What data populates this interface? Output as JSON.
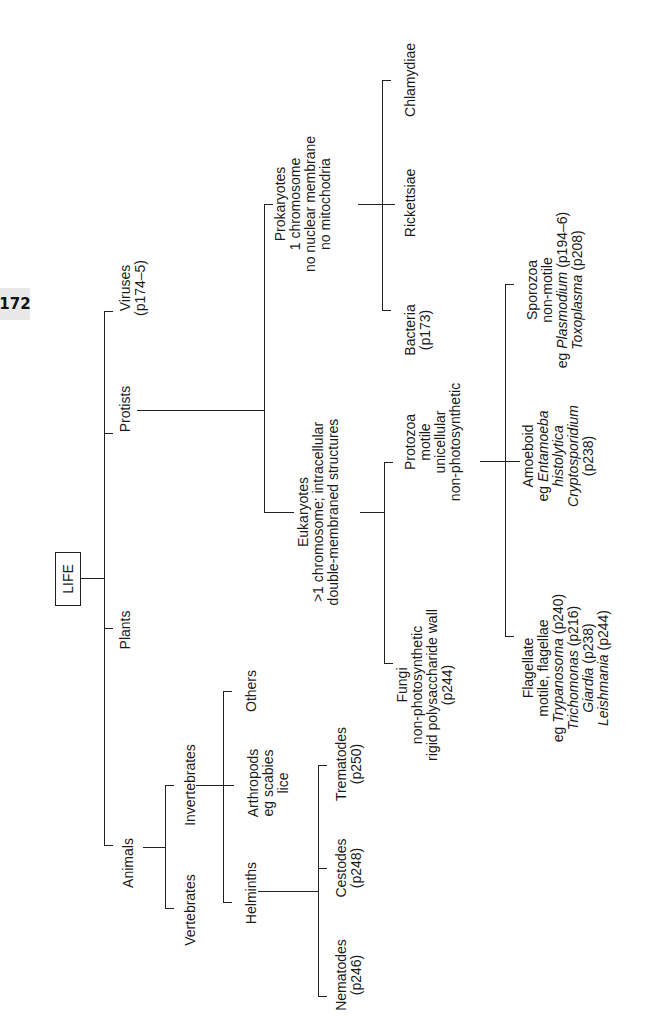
{
  "page": {
    "number": "172"
  },
  "diagram": {
    "root": "LIFE",
    "level1": {
      "viruses": {
        "name": "Viruses",
        "ref": "(p174–5)"
      },
      "protists": {
        "name": "Protists"
      },
      "plants": {
        "name": "Plants"
      },
      "animals": {
        "name": "Animals"
      }
    },
    "protists": {
      "prokaryotes": {
        "lines": [
          "Prokaryotes",
          "1 chromosome",
          "no nuclear membrane",
          "no mitochodria"
        ],
        "children": {
          "bacteria": {
            "name": "Bacteria",
            "ref": "(p173)"
          },
          "rickettsiae": {
            "name": "Rickettsiae"
          },
          "chlamydiae": {
            "name": "Chlamydiae"
          }
        }
      },
      "eukaryotes": {
        "lines": [
          "Eukaryotes",
          ">1 chromosome; intracellular",
          "double-membraned structures"
        ],
        "children": {
          "fungi": {
            "lines": [
              "Fungi",
              "non-photosynthetic",
              "rigid polysaccharide wall",
              "(p244)"
            ]
          },
          "protozoa": {
            "lines": [
              "Protozoa",
              "motile",
              "unicellular",
              "non-photosynthetic"
            ],
            "children": {
              "flagellate": {
                "l1": "Flagellate",
                "l2": "motile, flagellae",
                "l3_prefix": "eg ",
                "l3_italic": "Trypanosoma",
                "l3_ref": " (p240)",
                "l4_italic": "Trichomonas",
                "l4_ref": " (p216)",
                "l5_italic": "Giardia",
                "l5_ref": " (p238)",
                "l6_italic": "Leishmania",
                "l6_ref": " (p244)"
              },
              "amoeboid": {
                "l1": "Amoeboid",
                "l2_prefix": "eg ",
                "l2_italic": "Entamoeba",
                "l3_italic": "histolytica",
                "l4_italic": "Cryptosporidium",
                "l5": "(p238)"
              },
              "sporozoa": {
                "l1": "Sporozoa",
                "l2": "non-motile",
                "l3_prefix": "eg ",
                "l3_italic": "Plasmodium",
                "l3_ref": " (p194–6)",
                "l4_italic": "Toxoplasma",
                "l4_ref": " (p208)"
              }
            }
          }
        }
      }
    },
    "animals": {
      "vertebrates": {
        "name": "Vertebrates"
      },
      "invertebrates": {
        "name": "Invertebrates",
        "children": {
          "helminths": {
            "name": "Helminths",
            "children": {
              "nematodes": {
                "name": "Nematodes",
                "ref": "(p246)"
              },
              "cestodes": {
                "name": "Cestodes",
                "ref": "(p248)"
              },
              "trematodes": {
                "name": "Trematodes",
                "ref": "(p250)"
              }
            }
          },
          "arthropods": {
            "lines": [
              "Arthropods",
              "eg scabies",
              "lice"
            ]
          },
          "others": {
            "name": "Others"
          }
        }
      }
    }
  }
}
